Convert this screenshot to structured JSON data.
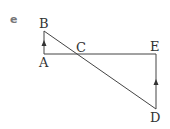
{
  "figure": {
    "part_label": "e",
    "points": {
      "A": {
        "label": "A",
        "x": 44,
        "y": 54
      },
      "B": {
        "label": "B",
        "x": 44,
        "y": 31
      },
      "C": {
        "label": "C",
        "x": 78,
        "y": 54
      },
      "D": {
        "label": "D",
        "x": 156,
        "y": 109
      },
      "E": {
        "label": "E",
        "x": 156,
        "y": 54
      }
    },
    "segments": [
      "AB",
      "AE",
      "ED",
      "BD"
    ],
    "parallel_markers": [
      "AB",
      "ED"
    ],
    "line_color": "#444444"
  }
}
